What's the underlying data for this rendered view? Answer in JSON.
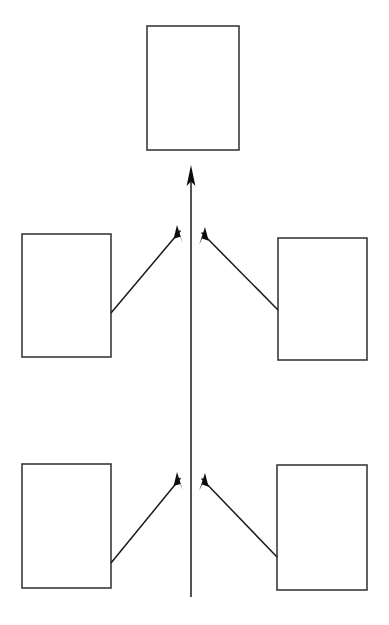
{
  "diagram": {
    "title": "",
    "background_color": "#ffffff",
    "box_stroke_color": "#3a3a3a",
    "line_color": "#1a1a1a",
    "arrow_fill_color": "#0d0d0d",
    "nodes": [
      {
        "id": "top",
        "label": "",
        "x": 147,
        "y": 26,
        "width": 92,
        "height": 124
      },
      {
        "id": "middle-left",
        "label": "",
        "x": 22,
        "y": 234,
        "width": 89,
        "height": 123
      },
      {
        "id": "middle-right",
        "label": "",
        "x": 278,
        "y": 238,
        "width": 89,
        "height": 122
      },
      {
        "id": "bottom-left",
        "label": "",
        "x": 22,
        "y": 464,
        "width": 89,
        "height": 124
      },
      {
        "id": "bottom-right",
        "label": "",
        "x": 277,
        "y": 465,
        "width": 90,
        "height": 125
      }
    ],
    "connectors": [
      {
        "id": "spine-to-top",
        "from": "spine-base",
        "to": "top",
        "x1": 191,
        "y1": 597,
        "x2": 191,
        "y2": 165,
        "arrow": "end"
      },
      {
        "id": "middle-left-to-spine",
        "from": "middle-left",
        "to": "spine",
        "x1": 111,
        "y1": 313,
        "x2": 177,
        "y2": 225,
        "arrow": "end"
      },
      {
        "id": "middle-right-to-spine",
        "from": "middle-right",
        "to": "spine",
        "x1": 278,
        "y1": 310,
        "x2": 205,
        "y2": 227,
        "arrow": "end"
      },
      {
        "id": "bottom-left-to-spine",
        "from": "bottom-left",
        "to": "spine",
        "x1": 111,
        "y1": 563,
        "x2": 177,
        "y2": 472,
        "arrow": "end"
      },
      {
        "id": "bottom-right-to-spine",
        "from": "bottom-right",
        "to": "spine",
        "x1": 277,
        "y1": 557,
        "x2": 205,
        "y2": 473,
        "arrow": "end"
      }
    ]
  }
}
